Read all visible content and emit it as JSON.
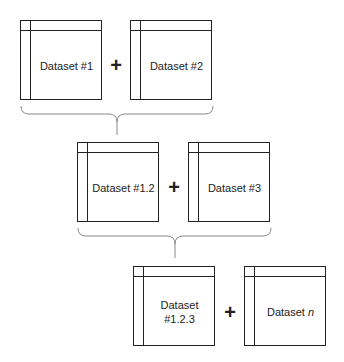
{
  "diagram": {
    "type": "iterative dataset merge",
    "steps": [
      {
        "left": "Dataset #1",
        "operator": "+",
        "right": "Dataset #2"
      },
      {
        "left": "Dataset #1.2",
        "operator": "+",
        "right": "Dataset #3"
      },
      {
        "left": "Dataset #1.2.3",
        "operator": "+",
        "right": "Dataset n"
      }
    ],
    "labels": {
      "d1": "Dataset #1",
      "d2": "Dataset #2",
      "d12": "Dataset #1.2",
      "d3": "Dataset #3",
      "d123_line1": "Dataset",
      "d123_line2": "#1.2.3",
      "dn_prefix": "Dataset ",
      "dn_var": "n",
      "plus": "+"
    },
    "colors": {
      "stroke": "#222222",
      "bracket": "#888888",
      "background": "#ffffff"
    }
  }
}
